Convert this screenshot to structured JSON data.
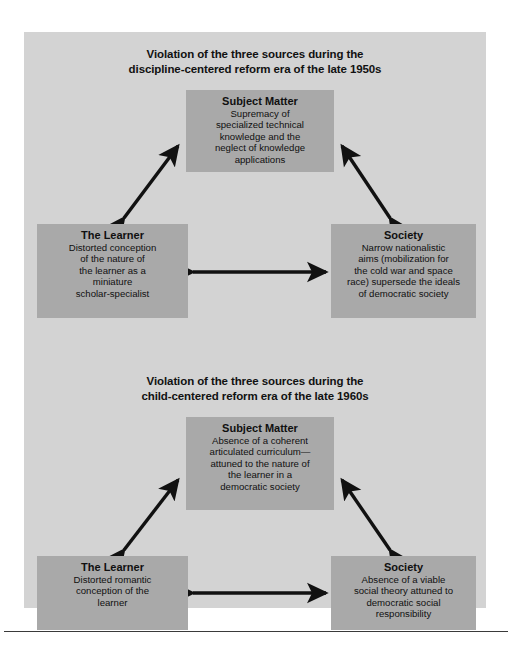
{
  "figure": {
    "background_color": "#ffffff",
    "panel_color": "#d3d3d3",
    "box_color": "#a9a9a9",
    "arrow_color": "#111111",
    "text_color": "#101010"
  },
  "diagrams": [
    {
      "id": "discipline-centered",
      "title_line_1": "Violation of the three sources during the",
      "title_line_2": "discipline-centered reform era of the late 1950s",
      "nodes": {
        "subject_matter": {
          "title": "Subject Matter",
          "body": "Supremacy of\nspecialized technical\nknowledge and the\nneglect of knowledge\napplications"
        },
        "learner": {
          "title": "The Learner",
          "body": "Distorted conception\nof the nature of\nthe learner as a\nminiature\nscholar-specialist"
        },
        "society": {
          "title": "Society",
          "body": "Narrow nationalistic\naims (mobilization for\nthe cold war and space\nrace) supersede the ideals\nof democratic society"
        }
      },
      "connections": [
        {
          "name": "learner-to-subject-matter",
          "style": "double-headed"
        },
        {
          "name": "society-to-subject-matter",
          "style": "double-headed"
        },
        {
          "name": "learner-to-society",
          "style": "double-headed"
        }
      ]
    },
    {
      "id": "child-centered",
      "title_line_1": "Violation of the three sources during the",
      "title_line_2": "child-centered reform era of the late 1960s",
      "nodes": {
        "subject_matter": {
          "title": "Subject Matter",
          "body": "Absence of a coherent\narticulated curriculum—\nattuned to the nature of\nthe learner in a\ndemocratic society"
        },
        "learner": {
          "title": "The Learner",
          "body": "Distorted romantic\nconception of the\nlearner"
        },
        "society": {
          "title": "Society",
          "body": "Absence of a viable\nsocial theory attuned to\ndemocratic social\nresponsibility"
        }
      },
      "connections": [
        {
          "name": "learner-to-subject-matter",
          "style": "double-headed"
        },
        {
          "name": "society-to-subject-matter",
          "style": "double-headed"
        },
        {
          "name": "learner-to-society",
          "style": "double-headed"
        }
      ]
    }
  ]
}
